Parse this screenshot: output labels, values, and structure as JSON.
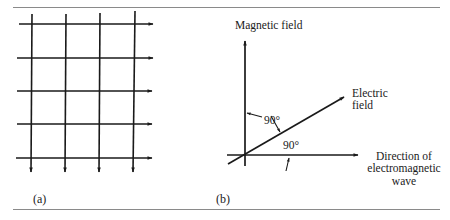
{
  "figure": {
    "panels": [
      {
        "id": "a",
        "label": "(a)",
        "description": "Grid of perpendicular field lines",
        "horizontal_lines": 5,
        "vertical_lines": 4,
        "horizontal_arrow_direction": "right",
        "vertical_arrow_direction": "down"
      },
      {
        "id": "b",
        "label": "(b)",
        "axes": {
          "vertical": "Magnetic field",
          "diagonal_line1": "Electric",
          "diagonal_line2": "field",
          "horizontal_line1": "Direction of",
          "horizontal_line2": "electromagnetic",
          "horizontal_line3": "wave"
        },
        "angles": {
          "upper": "90°",
          "lower": "90°"
        }
      }
    ],
    "colors": {
      "ink": "#1a1a1a",
      "rule": "#8a8a8a",
      "background": "#ffffff"
    }
  }
}
